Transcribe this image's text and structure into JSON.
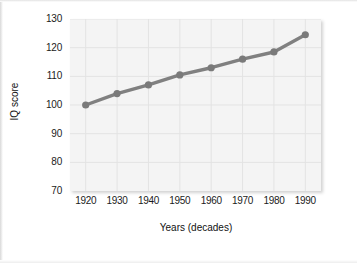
{
  "chart_data": {
    "type": "line",
    "title": "",
    "subtitle": "",
    "xlabel": "Years (decades)",
    "ylabel": "IQ score",
    "x": [
      1920,
      1930,
      1940,
      1950,
      1960,
      1970,
      1980,
      1990
    ],
    "categories": [
      "1920",
      "1930",
      "1940",
      "1950",
      "1960",
      "1970",
      "1980",
      "1990"
    ],
    "values": [
      100,
      104,
      107,
      110.5,
      113,
      116,
      118.5,
      124.5
    ],
    "series": [
      {
        "name": "IQ score",
        "values": [
          100,
          104,
          107,
          110.5,
          113,
          116,
          118.5,
          124.5
        ]
      }
    ],
    "xlim": [
      1915,
      1995
    ],
    "ylim": [
      70,
      130
    ],
    "xticks": [
      1920,
      1930,
      1940,
      1950,
      1960,
      1970,
      1980,
      1990
    ],
    "yticks": [
      70,
      80,
      90,
      100,
      110,
      120,
      130
    ],
    "ytick_labels": [
      "70",
      "80",
      "90",
      "100",
      "110",
      "120",
      "130"
    ],
    "xtick_labels": [
      "1920",
      "1930",
      "1940",
      "1950",
      "1960",
      "1970",
      "1980",
      "1990"
    ],
    "grid": true,
    "legend": false,
    "legend_position": "none",
    "annotations": [],
    "marker": "circle",
    "colors": {
      "line": "#808080",
      "marker": "#7a7a7a",
      "plot_background": "#f4f4f4",
      "gridline": "#e3e3e3",
      "axis_text": "#1b1b1b",
      "page_background": "#ffffff"
    }
  }
}
